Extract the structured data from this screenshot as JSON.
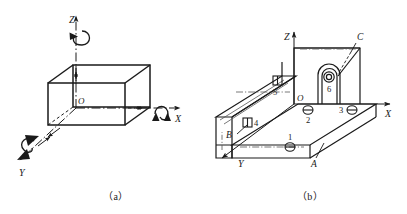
{
  "figure": {
    "caption_a": "（a）",
    "caption_b": "（b）",
    "stroke": "#1a1a1a",
    "thin_stroke": "#555555"
  },
  "view_a": {
    "name": "rectangular-block-with-axes",
    "axes": [
      {
        "id": "z",
        "label": "Z",
        "rotation_symbol": true
      },
      {
        "id": "x",
        "label": "X",
        "rotation_symbol": true
      },
      {
        "id": "y",
        "label": "Y",
        "rotation_symbol": true
      }
    ],
    "origin_label": "O"
  },
  "view_b": {
    "name": "channel-part-with-datums",
    "axes": [
      {
        "id": "z",
        "label": "Z"
      },
      {
        "id": "x",
        "label": "X"
      },
      {
        "id": "y",
        "label": "Y"
      }
    ],
    "origin_label": "O",
    "datums": [
      {
        "id": "a",
        "label": "A"
      },
      {
        "id": "b",
        "label": "B"
      },
      {
        "id": "c",
        "label": "C"
      }
    ],
    "markers": [
      {
        "id": "m1",
        "label": "1",
        "symbol": "surface-circle-bar"
      },
      {
        "id": "m2",
        "label": "2",
        "symbol": "surface-circle-bar"
      },
      {
        "id": "m3",
        "label": "3",
        "symbol": "surface-circle-bar"
      },
      {
        "id": "m4",
        "label": "4",
        "symbol": "surface-rect-bar"
      },
      {
        "id": "m5",
        "label": "5",
        "symbol": "surface-rect-bar"
      },
      {
        "id": "m6",
        "label": "6",
        "symbol": "hole-circle"
      }
    ]
  }
}
